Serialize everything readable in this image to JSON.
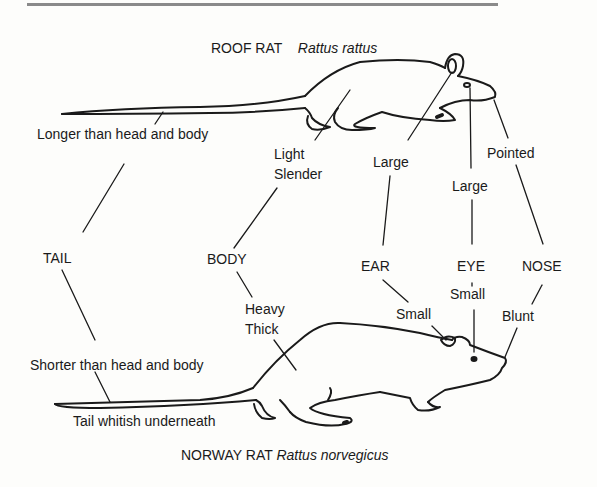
{
  "diagram": {
    "roof_rat": {
      "common_name": "ROOF RAT",
      "scientific_name": "Rattus rattus",
      "tail": "Longer than head and body",
      "body_line1": "Light",
      "body_line2": "Slender",
      "ear": "Large",
      "eye": "Large",
      "nose": "Pointed"
    },
    "features": {
      "tail": "TAIL",
      "body": "BODY",
      "ear": "EAR",
      "eye": "EYE",
      "nose": "NOSE"
    },
    "norway_rat": {
      "common_name": "NORWAY RAT",
      "scientific_name": "Rattus norvegicus",
      "tail": "Shorter than head and body",
      "tail_note": "Tail whitish underneath",
      "body_line1": "Heavy",
      "body_line2": "Thick",
      "ear": "Small",
      "eye": "Small",
      "nose": "Blunt"
    }
  }
}
